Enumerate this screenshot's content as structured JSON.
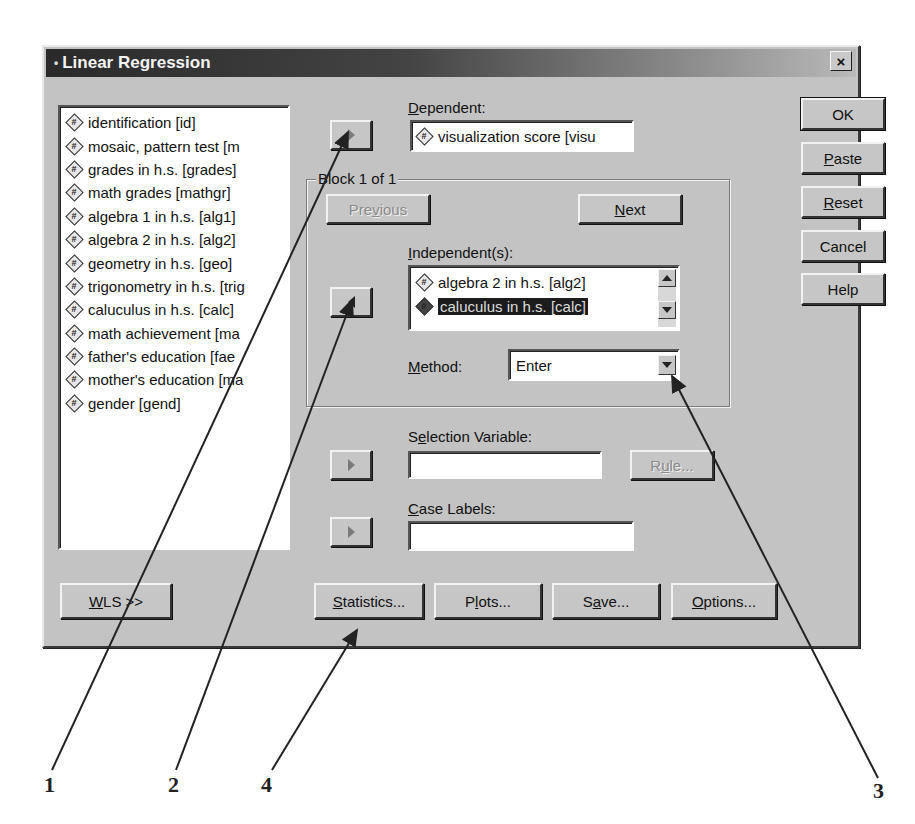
{
  "window": {
    "title": "Linear Regression",
    "close_label": "×"
  },
  "variables": {
    "items": [
      {
        "label": "identification [id]",
        "icon": "numeric-scale-icon"
      },
      {
        "label": "mosaic, pattern test [m",
        "icon": "numeric-scale-icon"
      },
      {
        "label": "grades in h.s. [grades]",
        "icon": "numeric-scale-icon"
      },
      {
        "label": "math grades [mathgr]",
        "icon": "numeric-scale-icon"
      },
      {
        "label": "algebra 1 in h.s. [alg1]",
        "icon": "numeric-scale-icon"
      },
      {
        "label": "algebra 2 in h.s. [alg2]",
        "icon": "numeric-scale-icon"
      },
      {
        "label": "geometry in h.s. [geo]",
        "icon": "numeric-scale-icon"
      },
      {
        "label": "trigonometry in h.s. [trig",
        "icon": "numeric-scale-icon"
      },
      {
        "label": "caluculus in h.s. [calc]",
        "icon": "numeric-scale-icon"
      },
      {
        "label": "math achievement [ma",
        "icon": "numeric-scale-icon"
      },
      {
        "label": "father's education [fae",
        "icon": "numeric-scale-icon"
      },
      {
        "label": "mother's education [ma",
        "icon": "numeric-scale-icon"
      },
      {
        "label": "gender [gend]",
        "icon": "numeric-scale-icon"
      }
    ]
  },
  "dependent": {
    "label_mn": "D",
    "label_rest": "ependent:",
    "value": "visualization score [visu"
  },
  "block": {
    "legend": "Block 1 of 1",
    "previous_pre": "Pre",
    "previous_mn": "v",
    "previous_post": "ious",
    "next_mn": "N",
    "next_rest": "ext"
  },
  "independents": {
    "label_mn": "I",
    "label_rest": "ndependent(s):",
    "items": [
      {
        "label": "algebra 2 in h.s. [alg2]",
        "selected": false
      },
      {
        "label": "caluculus in h.s. [calc]",
        "selected": true
      }
    ]
  },
  "method": {
    "label_mn": "M",
    "label_rest": "ethod:",
    "value": "Enter"
  },
  "selection_variable": {
    "label_pre": "S",
    "label_mn": "e",
    "label_rest": "lection Variable:",
    "value": "",
    "rule_pre": "R",
    "rule_mn": "u",
    "rule_post": "le..."
  },
  "case_labels": {
    "label_mn": "C",
    "label_rest": "ase Labels:",
    "value": ""
  },
  "side_buttons": {
    "ok": "OK",
    "paste_mn": "P",
    "paste_rest": "aste",
    "reset_mn": "R",
    "reset_rest": "eset",
    "cancel": "Cancel",
    "help": "Help"
  },
  "bottom_buttons": {
    "wls_mn": "W",
    "wls_rest": "LS >>",
    "statistics_mn": "S",
    "statistics_rest": "tatistics...",
    "plots_pre": "P",
    "plots_mn": "l",
    "plots_rest": "ots...",
    "save_pre": "S",
    "save_mn": "a",
    "save_rest": "ve...",
    "options_mn": "O",
    "options_rest": "ptions..."
  },
  "callouts": [
    "1",
    "2",
    "3",
    "4"
  ]
}
